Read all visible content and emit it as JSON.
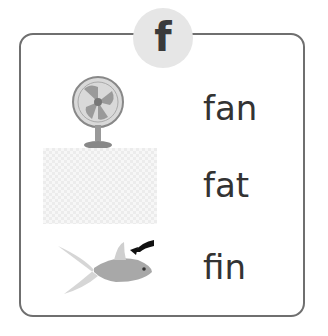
{
  "letter": "f",
  "items": [
    {
      "word": "fan",
      "image": "fan-icon"
    },
    {
      "word": "fat",
      "image": "placeholder-image"
    },
    {
      "word": "fin",
      "image": "goldfish-fin-icon"
    }
  ],
  "colors": {
    "border": "#6f6f6f",
    "badge": "#e6e6e6",
    "text": "#333333"
  }
}
